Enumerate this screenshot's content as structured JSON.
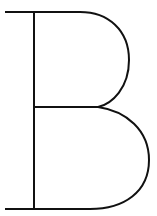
{
  "glyph": {
    "character": "B",
    "stroke_color": "#111111",
    "background_color": "#ffffff"
  }
}
